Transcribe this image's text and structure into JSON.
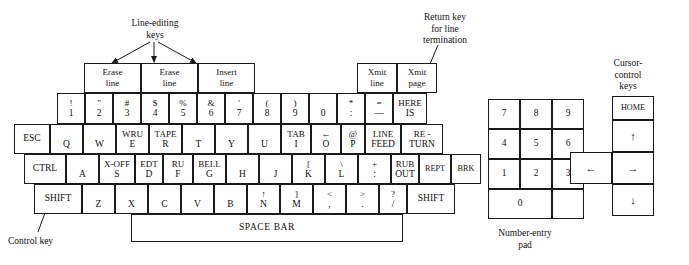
{
  "figure": {
    "kind": "terminal-keyboard-layout-diagram",
    "background": "#ffffff",
    "ink": "#1a1a1a"
  },
  "annotations": {
    "line_editing_title": "Line-editing",
    "line_editing_title2": "keys",
    "return_key_l1": "Return key",
    "return_key_l2": "for line",
    "return_key_l3": "termination",
    "cursor_l1": "Cursor-",
    "cursor_l2": "control",
    "cursor_l3": "keys",
    "control_key": "Control key",
    "numpad_l1": "Number-entry",
    "numpad_l2": "pad"
  },
  "callouts": [
    {
      "name": "erase-line-1",
      "l1": "Erase",
      "l2": "line"
    },
    {
      "name": "erase-line-2",
      "l1": "Erase",
      "l2": "line"
    },
    {
      "name": "insert-line",
      "l1": "Insert",
      "l2": "line"
    },
    {
      "name": "xmit-line",
      "l1": "Xmit",
      "l2": "line"
    },
    {
      "name": "xmit-page",
      "l1": "Xmit",
      "l2": "page"
    }
  ],
  "keyboard": {
    "row_number": [
      {
        "name": "key-1",
        "up": "!",
        "lo": "1"
      },
      {
        "name": "key-2",
        "up": "\"",
        "lo": "2"
      },
      {
        "name": "key-3",
        "up": "#",
        "lo": "3"
      },
      {
        "name": "key-4",
        "up": "$",
        "lo": "4"
      },
      {
        "name": "key-5",
        "up": "%",
        "lo": "5"
      },
      {
        "name": "key-6",
        "up": "&",
        "lo": "6"
      },
      {
        "name": "key-7",
        "up": "'",
        "lo": "7"
      },
      {
        "name": "key-8",
        "up": "(",
        "lo": "8"
      },
      {
        "name": "key-9",
        "up": ")",
        "lo": "9"
      },
      {
        "name": "key-0",
        "up": "",
        "lo": "0"
      },
      {
        "name": "key-colon-star",
        "up": "*",
        "lo": ":"
      },
      {
        "name": "key-equals-underscore",
        "up": "=",
        "lo": "—"
      },
      {
        "name": "key-here-is",
        "up": "HERE",
        "lo": "IS"
      }
    ],
    "row_qwerty": [
      {
        "name": "key-esc",
        "label": "ESC"
      },
      {
        "name": "key-q",
        "up": "",
        "lo": "Q"
      },
      {
        "name": "key-w",
        "up": "",
        "lo": "W"
      },
      {
        "name": "key-e",
        "up": "WRU",
        "lo": "E"
      },
      {
        "name": "key-r",
        "up": "TAPE",
        "lo": "R"
      },
      {
        "name": "key-t",
        "up": "",
        "lo": "T"
      },
      {
        "name": "key-y",
        "up": "",
        "lo": "Y"
      },
      {
        "name": "key-u",
        "up": "",
        "lo": "U"
      },
      {
        "name": "key-i",
        "up": "TAB",
        "lo": "I"
      },
      {
        "name": "key-o",
        "up": "←",
        "lo": "O"
      },
      {
        "name": "key-p",
        "up": "@",
        "lo": "P"
      },
      {
        "name": "key-line-feed",
        "up": "LINE",
        "lo": "FEED"
      },
      {
        "name": "key-return",
        "up": "RE -",
        "lo": "TURN"
      }
    ],
    "row_asdf": [
      {
        "name": "key-ctrl",
        "label": "CTRL"
      },
      {
        "name": "key-a",
        "up": "",
        "lo": "A"
      },
      {
        "name": "key-s",
        "up": "X-OFF",
        "lo": "S"
      },
      {
        "name": "key-d",
        "up": "EDT",
        "lo": "D"
      },
      {
        "name": "key-f",
        "up": "RU",
        "lo": "F"
      },
      {
        "name": "key-g",
        "up": "BELL",
        "lo": "G"
      },
      {
        "name": "key-h",
        "up": "",
        "lo": "H"
      },
      {
        "name": "key-j",
        "up": "",
        "lo": "J"
      },
      {
        "name": "key-k",
        "up": "[",
        "lo": "K"
      },
      {
        "name": "key-l",
        "up": "\\",
        "lo": "L"
      },
      {
        "name": "key-semicolon",
        "up": "+",
        "lo": ":"
      },
      {
        "name": "key-rub-out",
        "up": "RUB",
        "lo": "OUT"
      },
      {
        "name": "key-rept",
        "label": "REPT"
      },
      {
        "name": "key-brk",
        "label": "BRK"
      }
    ],
    "row_zxcv": [
      {
        "name": "key-shift-left",
        "label": "SHIFT"
      },
      {
        "name": "key-z",
        "up": "",
        "lo": "Z"
      },
      {
        "name": "key-x",
        "up": "",
        "lo": "X"
      },
      {
        "name": "key-c",
        "up": "",
        "lo": "C"
      },
      {
        "name": "key-v",
        "up": "",
        "lo": "V"
      },
      {
        "name": "key-b",
        "up": "",
        "lo": "B"
      },
      {
        "name": "key-n",
        "up": "↑",
        "lo": "N"
      },
      {
        "name": "key-m",
        "up": "]",
        "lo": "M"
      },
      {
        "name": "key-comma",
        "up": "<",
        "lo": ","
      },
      {
        "name": "key-period",
        "up": ">",
        "lo": "."
      },
      {
        "name": "key-slash",
        "up": "?",
        "lo": "/"
      },
      {
        "name": "key-shift-right",
        "label": "SHIFT"
      }
    ],
    "space_bar": {
      "name": "key-space-bar",
      "label": "SPACE BAR"
    }
  },
  "numpad": {
    "rows": [
      [
        {
          "name": "numpad-key-7",
          "label": "7"
        },
        {
          "name": "numpad-key-8",
          "label": "8"
        },
        {
          "name": "numpad-key-9",
          "label": "9"
        }
      ],
      [
        {
          "name": "numpad-key-4",
          "label": "4"
        },
        {
          "name": "numpad-key-5",
          "label": "5"
        },
        {
          "name": "numpad-key-6",
          "label": "6"
        }
      ],
      [
        {
          "name": "numpad-key-1",
          "label": "1"
        },
        {
          "name": "numpad-key-2",
          "label": "2"
        },
        {
          "name": "numpad-key-3",
          "label": "3"
        }
      ]
    ],
    "zero": {
      "name": "numpad-key-0",
      "label": "0"
    },
    "blank": {
      "name": "numpad-key-blank",
      "label": ""
    }
  },
  "cursor_pad": {
    "home": {
      "name": "cursor-key-home",
      "label": "HOME"
    },
    "up": {
      "name": "cursor-key-up",
      "label": "↑"
    },
    "left": {
      "name": "cursor-key-left",
      "label": "←"
    },
    "right": {
      "name": "cursor-key-right",
      "label": "→"
    },
    "down": {
      "name": "cursor-key-down",
      "label": "↓"
    }
  }
}
